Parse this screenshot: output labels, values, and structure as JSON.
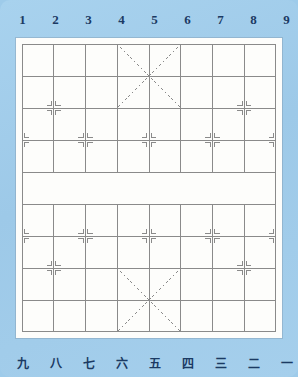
{
  "board": {
    "name": "xiangqi-board",
    "type": "chinese-chess-board",
    "files": 9,
    "ranks": 10,
    "background_color": "#9ecbea",
    "board_color": "#fdfdfb",
    "line_color": "#8a8a8a",
    "label_color": "#1b3a63",
    "river": {
      "present": true,
      "blank": true
    }
  },
  "top_labels": [
    "1",
    "2",
    "3",
    "4",
    "5",
    "6",
    "7",
    "8",
    "9"
  ],
  "bottom_labels": [
    "九",
    "八",
    "七",
    "六",
    "五",
    "四",
    "三",
    "二",
    "一"
  ],
  "chart_data": {
    "type": "table",
    "xlabel": "file",
    "ylabel": "rank",
    "x": [
      1,
      2,
      3,
      4,
      5,
      6,
      7,
      8,
      9
    ],
    "categories": [
      "1",
      "2",
      "3",
      "4",
      "5",
      "6",
      "7",
      "8",
      "9"
    ],
    "values": [
      10,
      10,
      10,
      10,
      10,
      10,
      10,
      10,
      10
    ],
    "grid": true,
    "legend": "none",
    "xlim": [
      1,
      9
    ],
    "ylim": [
      1,
      10
    ],
    "palace_top": {
      "file_from": 4,
      "file_to": 6,
      "rank_from": 1,
      "rank_to": 3
    },
    "palace_bottom": {
      "file_from": 4,
      "file_to": 6,
      "rank_from": 8,
      "rank_to": 10
    },
    "cannon_points": [
      {
        "file": 2,
        "rank": 3
      },
      {
        "file": 8,
        "rank": 3
      },
      {
        "file": 2,
        "rank": 8
      },
      {
        "file": 8,
        "rank": 8
      }
    ],
    "pawn_points": [
      {
        "file": 1,
        "rank": 4
      },
      {
        "file": 3,
        "rank": 4
      },
      {
        "file": 5,
        "rank": 4
      },
      {
        "file": 7,
        "rank": 4
      },
      {
        "file": 9,
        "rank": 4
      },
      {
        "file": 1,
        "rank": 7
      },
      {
        "file": 3,
        "rank": 7
      },
      {
        "file": 5,
        "rank": 7
      },
      {
        "file": 7,
        "rank": 7
      },
      {
        "file": 9,
        "rank": 7
      }
    ]
  }
}
